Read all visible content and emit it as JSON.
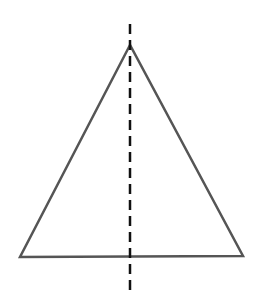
{
  "diagram": {
    "triangle": {
      "apex": [
        130,
        45
      ],
      "base_left": [
        20,
        257
      ],
      "base_right": [
        243,
        256
      ],
      "stroke_color": "#555555",
      "fill_color": "#ffffff"
    },
    "symmetry_line": {
      "x": 130,
      "y_start": 24,
      "y_end": 293,
      "style": "dashed",
      "color": "#111111"
    }
  }
}
